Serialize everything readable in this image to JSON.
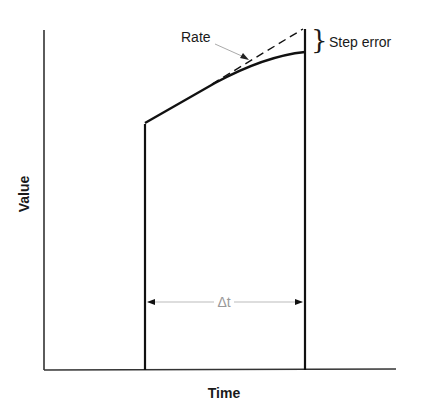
{
  "diagram": {
    "axes": {
      "xlabel": "Time",
      "ylabel": "Value"
    },
    "annotations": {
      "rate": "Rate",
      "step_error": "Step error",
      "delta_t": "Δt"
    },
    "colors": {
      "line": "#111111",
      "arrow": "#bbbbbb",
      "delta_text": "#999999"
    }
  }
}
